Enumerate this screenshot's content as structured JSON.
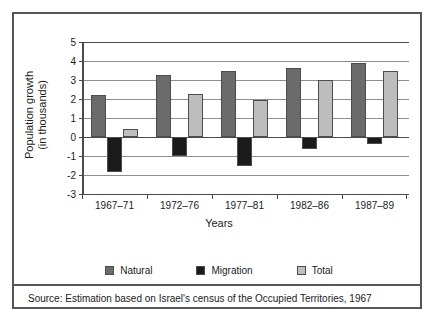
{
  "chart_data": {
    "type": "bar",
    "title": "",
    "subtitle": "",
    "xlabel": "Years",
    "ylabel": "Population growth\n(in thousands)",
    "ylabel_line1": "Population growth",
    "ylabel_line2": "(in thousands)",
    "categories": [
      "1967–71",
      "1972–76",
      "1977–81",
      "1982–86",
      "1987–89"
    ],
    "series": [
      {
        "name": "Natural",
        "color": "#6b6b6b",
        "values": [
          2.2,
          3.25,
          3.45,
          3.65,
          3.9
        ]
      },
      {
        "name": "Migration",
        "color": "#1a1a1a",
        "values": [
          -1.85,
          -1.0,
          -1.5,
          -0.65,
          -0.35
        ]
      },
      {
        "name": "Total",
        "color": "#bdbdbd",
        "values": [
          0.4,
          2.25,
          1.95,
          3.0,
          3.5
        ]
      }
    ],
    "ylim": [
      -3,
      5
    ],
    "ytick_step": 1,
    "yticks": [
      5,
      4,
      3,
      2,
      1,
      0,
      -1,
      -2,
      -3
    ],
    "ytick_labels": [
      "5",
      "4",
      "3",
      "2",
      "1",
      "0",
      "-1",
      "-2",
      "-3"
    ],
    "grid": true,
    "grid_axis": "y",
    "legend_position": "bottom",
    "zero_line": 0
  },
  "source": {
    "note": "Source: Estimation based on Israel's census of the Occupied Territories, 1967"
  },
  "colors": {
    "natural": "#6b6b6b",
    "migration": "#1a1a1a",
    "total": "#bdbdbd",
    "axis": "#4a4a4a",
    "grid": "#8e8e8e",
    "border": "#565656",
    "background": "#ffffff"
  }
}
